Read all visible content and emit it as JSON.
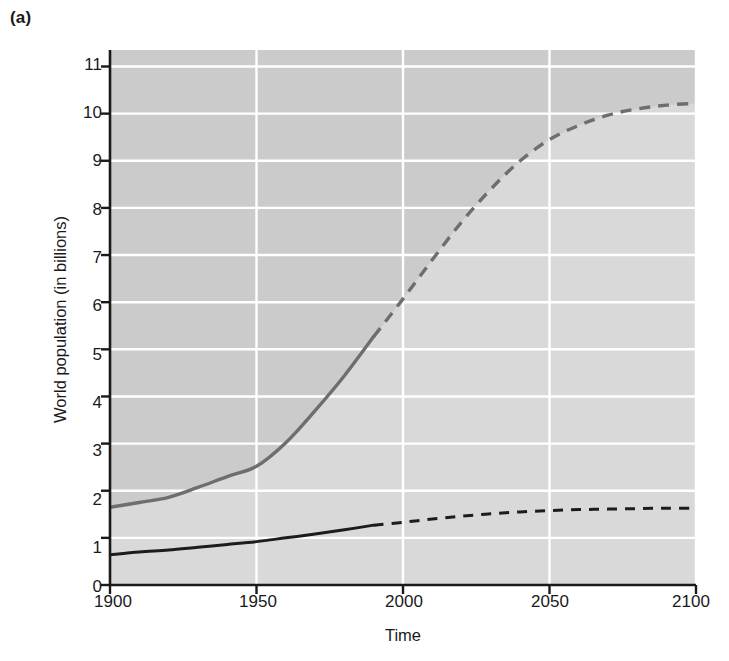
{
  "figure": {
    "panel_label": "(a)",
    "background_color": "#ffffff"
  },
  "chart_data": {
    "type": "line",
    "title": "",
    "subtitle": "",
    "xlabel": "Time",
    "ylabel": "World population (in billions)",
    "xlim": [
      1900,
      2100
    ],
    "ylim": [
      0,
      11.35
    ],
    "xticks": [
      1900,
      1950,
      2000,
      2050,
      2100
    ],
    "yticks": [
      0,
      1,
      2,
      3,
      4,
      5,
      6,
      7,
      8,
      9,
      10,
      11
    ],
    "xtick_labels": [
      "1900",
      "1950",
      "2000",
      "2050",
      "2100"
    ],
    "ytick_labels": [
      "0",
      "1",
      "2",
      "3",
      "4",
      "5",
      "6",
      "7",
      "8",
      "9",
      "10",
      "11"
    ],
    "grid": "white gridlines on gray plot background, horizontal at every y tick and vertical at every x tick",
    "legend": "none — series identified by inline annotations",
    "plot_background_color": "#d8d8d8",
    "upper_region_color": "#cbcbcb",
    "gridline_color": "#ffffff",
    "axis_color": "#1a1a1a",
    "historical_end_year": 1990,
    "series": [
      {
        "name": "World total",
        "color": "#6e6e6e",
        "line_width": 3.4,
        "historical_style": "solid",
        "projection_style": "dashed",
        "x": [
          1900,
          1910,
          1920,
          1930,
          1940,
          1950,
          1960,
          1970,
          1980,
          1990,
          2000,
          2010,
          2020,
          2030,
          2040,
          2050,
          2060,
          2070,
          2080,
          2090,
          2100
        ],
        "values": [
          1.65,
          1.75,
          1.86,
          2.07,
          2.3,
          2.52,
          3.02,
          3.7,
          4.44,
          5.27,
          6.07,
          6.9,
          7.7,
          8.4,
          9.0,
          9.45,
          9.75,
          9.97,
          10.1,
          10.18,
          10.22
        ]
      },
      {
        "name": "Developed countries",
        "color": "#1c1c1c",
        "line_width": 3.0,
        "historical_style": "solid",
        "projection_style": "dashed",
        "x": [
          1900,
          1910,
          1920,
          1930,
          1940,
          1950,
          1960,
          1970,
          1980,
          1990,
          2000,
          2010,
          2020,
          2030,
          2040,
          2050,
          2060,
          2070,
          2080,
          2090,
          2100
        ],
        "values": [
          0.64,
          0.7,
          0.74,
          0.8,
          0.86,
          0.92,
          1.0,
          1.08,
          1.17,
          1.27,
          1.33,
          1.4,
          1.46,
          1.51,
          1.55,
          1.58,
          1.6,
          1.61,
          1.62,
          1.63,
          1.63
        ]
      }
    ],
    "annotations": [
      {
        "text": "World total",
        "x_year": 1935,
        "y_value": 8.05
      },
      {
        "text": "Developing",
        "x_year": 2032,
        "y_value": 5.15
      },
      {
        "text": "countries",
        "x_year": 2032,
        "y_value": 4.72
      },
      {
        "text": "Developed countries",
        "x_year": 2013,
        "y_value": 0.93
      }
    ]
  }
}
